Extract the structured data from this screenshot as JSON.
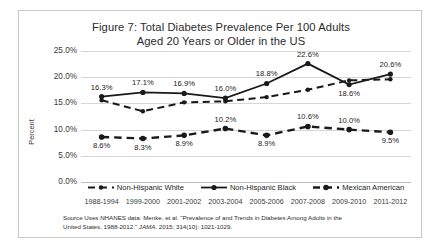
{
  "figure": {
    "title_line1": "Figure 7: Total Diabetes Prevalence Per 100 Adults",
    "title_line2": "Aged 20 Years or Older in the US",
    "source_line1": "Source Uses NHANES data: Menke, et al. \"Prevalence of and Trends in Diabetes Among Adults in the",
    "source_line2_pre": "United States, 1988-2012.\" ",
    "source_line2_journal": "JAMA",
    "source_line2_post": ". 2015; 314(10): 1021-1029."
  },
  "chart_data": {
    "type": "line",
    "title": "Figure 7: Total Diabetes Prevalence Per 100 Adults Aged 20 Years or Older in the US",
    "xlabel": "",
    "ylabel": "Percent",
    "ylim": [
      0,
      25
    ],
    "ytick_labels": [
      "25.0%",
      "20.0%",
      "15.0%",
      "10.0%",
      "5.0%",
      "0.0%"
    ],
    "ytick_values": [
      25,
      20,
      15,
      10,
      5,
      0
    ],
    "grid": true,
    "legend_position": "bottom",
    "categories": [
      "1988-1994",
      "1999-2000",
      "2001-2002",
      "2003-2004",
      "2005-2006",
      "2007-2008",
      "2009-2010",
      "2011-2012"
    ],
    "series": [
      {
        "name": "Non-Hispanic White",
        "style": "dashed-thin",
        "values": [
          15.6,
          13.5,
          15.2,
          15.4,
          16.2,
          17.6,
          19.4,
          19.6
        ],
        "labels": [
          "",
          "",
          "",
          "",
          "",
          "",
          "",
          ""
        ]
      },
      {
        "name": "Non-Hispanic Black",
        "style": "solid-thick",
        "values": [
          16.3,
          17.1,
          16.9,
          16.0,
          18.8,
          22.6,
          18.6,
          20.6
        ],
        "labels": [
          "16.3%",
          "17.1%",
          "16.9%",
          "16.0%",
          "18.8%",
          "22.6%",
          "18.6%",
          "20.6%"
        ],
        "label_positions": [
          "above",
          "above",
          "above",
          "above",
          "above",
          "above",
          "below",
          "above"
        ]
      },
      {
        "name": "Mexican American",
        "style": "dashed-thick",
        "values": [
          8.6,
          8.3,
          8.9,
          10.2,
          8.9,
          10.6,
          10.0,
          9.5
        ],
        "labels": [
          "8.6%",
          "8.3%",
          "8.9%",
          "10.2%",
          "8.9%",
          "10.6%",
          "10.0%",
          "9.5%"
        ],
        "label_positions": [
          "below",
          "below",
          "below",
          "above",
          "below",
          "above",
          "above",
          "below"
        ]
      }
    ]
  },
  "colors": {
    "series_line": "#1a1a1a",
    "gridline": "#d6d6d6",
    "frame_border": "#c9c9c9",
    "text": "#1c1c1c"
  }
}
